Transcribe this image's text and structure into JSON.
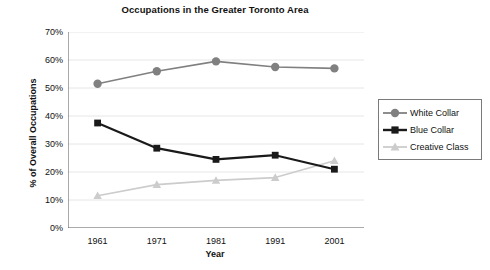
{
  "chart_data": {
    "type": "line",
    "title": "Occupations in the Greater Toronto Area",
    "xlabel": "Year",
    "ylabel": "% of Overall Occupations",
    "x": [
      1961,
      1971,
      1981,
      1991,
      2001
    ],
    "categories": [
      "1961",
      "1971",
      "1981",
      "1991",
      "2001"
    ],
    "xlim": [
      1956,
      2006
    ],
    "ylim": [
      0,
      70
    ],
    "ytick_values": [
      0,
      10,
      20,
      30,
      40,
      50,
      60,
      70
    ],
    "ytick_labels": [
      "0%",
      "10%",
      "20%",
      "30%",
      "40%",
      "50%",
      "60%",
      "70%"
    ],
    "grid": "horizontal",
    "legend_position": "right",
    "series": [
      {
        "name": "White Collar",
        "values": [
          51.5,
          56.0,
          59.5,
          57.5,
          57.0
        ],
        "color": "#808080",
        "marker": "circle"
      },
      {
        "name": "Blue Collar",
        "values": [
          37.5,
          28.5,
          24.5,
          26.0,
          21.0
        ],
        "color": "#1a1a1a",
        "marker": "square"
      },
      {
        "name": "Creative Class",
        "values": [
          11.5,
          15.5,
          17.0,
          18.0,
          24.0
        ],
        "color": "#cccccc",
        "marker": "triangle"
      }
    ]
  },
  "legend": {
    "items": [
      {
        "label": "White Collar"
      },
      {
        "label": "Blue Collar"
      },
      {
        "label": "Creative Class"
      }
    ]
  },
  "colors": {
    "axis": "#555555",
    "grid": "#e6e6e6",
    "background": "#ffffff",
    "text": "#111111"
  }
}
